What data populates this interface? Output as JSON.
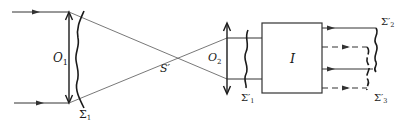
{
  "diagram": {
    "colors": {
      "line": "#333333",
      "text": "#1a1a1a",
      "background": "#ffffff"
    },
    "labels": {
      "lens1": "O",
      "lens1_sub": "1",
      "wavefront1": "Σ",
      "wavefront1_sub": "1",
      "focus": "S′",
      "lens2": "O",
      "lens2_sub": "2",
      "wavefront1_prime": "Σ′",
      "wavefront1_prime_sub": "1",
      "interferometer": "I",
      "wavefront2_prime": "Σ′",
      "wavefront2_prime_sub": "2",
      "wavefront3_prime": "Σ′",
      "wavefront3_prime_sub": "3"
    },
    "elements": [
      {
        "id": "input-rays",
        "type": "rays",
        "count": 2,
        "direction": "right"
      },
      {
        "id": "lens-O1",
        "type": "converging-lens"
      },
      {
        "id": "wavefront-Sigma1",
        "type": "distorted-wavefront"
      },
      {
        "id": "focal-point-S-prime",
        "type": "point"
      },
      {
        "id": "lens-O2",
        "type": "converging-lens"
      },
      {
        "id": "wavefront-Sigma1-prime",
        "type": "distorted-wavefront"
      },
      {
        "id": "interferometer-I",
        "type": "box"
      },
      {
        "id": "output-rays",
        "type": "rays",
        "solid": 2,
        "dashed": 2
      },
      {
        "id": "wavefront-Sigma2-prime",
        "type": "distorted-wavefront"
      },
      {
        "id": "wavefront-Sigma3-prime",
        "type": "distorted-wavefront",
        "style": "dashed"
      }
    ]
  }
}
